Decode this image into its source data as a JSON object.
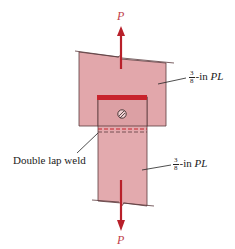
{
  "diagram": {
    "type": "double lap weld plate connection",
    "load_top": "P",
    "load_bottom": "P",
    "top_plate_label": {
      "num": "3",
      "den": "8",
      "suffix": "-in",
      "name": "PL"
    },
    "bottom_plate_label": {
      "num": "3",
      "den": "8",
      "suffix": "-in",
      "name": "PL"
    },
    "weld_label": "Double lap weld",
    "colors": {
      "plate_fill": "#e2a7ab",
      "plate_edge": "#5a3a3c",
      "weld": "#c8232c",
      "arrow": "#b8202a",
      "load_text": "#c0404a"
    }
  }
}
